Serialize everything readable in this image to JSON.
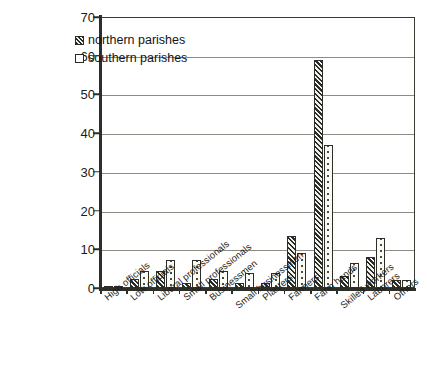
{
  "chart_data": {
    "type": "bar",
    "title": "",
    "xlabel": "",
    "ylabel": "",
    "ylim": [
      0,
      70
    ],
    "yticks": [
      0,
      10,
      20,
      30,
      40,
      50,
      60,
      70
    ],
    "grid": true,
    "legend_position": "top-left",
    "categories": [
      "High officials",
      "Low officials",
      "Liberal professionals",
      "Small professionals",
      "Businessmen",
      "Small businessmen",
      "Planters",
      "Farmers",
      "Farm hands",
      "Skilled workers",
      "Laborers",
      "Others"
    ],
    "series": [
      {
        "name": "northern parishes",
        "pattern": "diagonal-hatch",
        "values": [
          0.3,
          2.2,
          4.5,
          1.3,
          2.4,
          1.2,
          1.3,
          13.5,
          59,
          3,
          8,
          2
        ]
      },
      {
        "name": "southern parishes",
        "pattern": "dotted",
        "values": [
          0.3,
          4.5,
          7.2,
          7.2,
          4.4,
          4,
          3.8,
          9,
          37,
          6.5,
          13,
          2
        ]
      }
    ]
  },
  "legend": {
    "items": [
      {
        "label": "northern parishes"
      },
      {
        "label": "southern parishes"
      }
    ]
  },
  "colors": {
    "axis": "#2e2e28",
    "grid": "#8c8c84",
    "bar_outline": "#2e2e28",
    "background": "#ffffff"
  }
}
